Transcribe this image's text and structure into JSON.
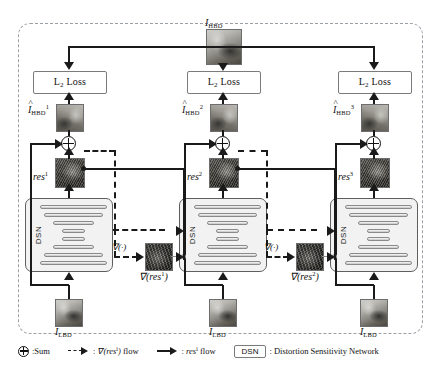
{
  "figure": {
    "title_label": "I_HBD",
    "top_image_label_base": "I",
    "top_image_label_sub": "HBD"
  },
  "frame": {
    "style": "dashed-rounded"
  },
  "loss_boxes": [
    {
      "text": "L",
      "sub": "2",
      "suffix": " Loss"
    },
    {
      "text": "L",
      "sub": "2",
      "suffix": " Loss"
    },
    {
      "text": "L",
      "sub": "2",
      "suffix": " Loss"
    }
  ],
  "stages": [
    {
      "index": 1,
      "output_label_base": "I",
      "output_label_sub": "HBD",
      "output_label_sup": "1",
      "output_hat": "^",
      "residual_label": "res",
      "residual_sup": "1",
      "grad_label": "∇(res",
      "grad_sup": "1",
      "grad_suffix": ")",
      "grad_op_label": "∇(·)",
      "dsn_label": "DSN",
      "input_label_base": "I",
      "input_label_sub": "LBD"
    },
    {
      "index": 2,
      "output_label_base": "I",
      "output_label_sub": "HBD",
      "output_label_sup": "2",
      "output_hat": "^",
      "residual_label": "res",
      "residual_sup": "2",
      "grad_label": "∇(res",
      "grad_sup": "2",
      "grad_suffix": ")",
      "grad_op_label": "∇(·)",
      "dsn_label": "DSN",
      "input_label_base": "I",
      "input_label_sub": "LBD"
    },
    {
      "index": 3,
      "output_label_base": "I",
      "output_label_sub": "HBD",
      "output_label_sup": "3",
      "output_hat": "^",
      "residual_label": "res",
      "residual_sup": "3",
      "dsn_label": "DSN",
      "input_label_base": "I",
      "input_label_sub": "LBD"
    }
  ],
  "legend": {
    "sum_text": ":Sum",
    "grad_flow_prefix": ":",
    "grad_flow_text": "∇(res",
    "grad_flow_sup": "i",
    "grad_flow_suffix": ") flow",
    "res_flow_prefix": ":",
    "res_flow_text": "res",
    "res_flow_sup": "i",
    "res_flow_suffix": " flow",
    "dsn_box_text": "DSN",
    "dsn_meaning": ": Distortion Sensitivity Network"
  },
  "colors": {
    "line": "#1a1a1a",
    "frame": "#9aa0a6",
    "box_border": "#7b7b7b",
    "dsn_fill": "#f2f2f2",
    "dsn_border": "#5f5f5f"
  }
}
